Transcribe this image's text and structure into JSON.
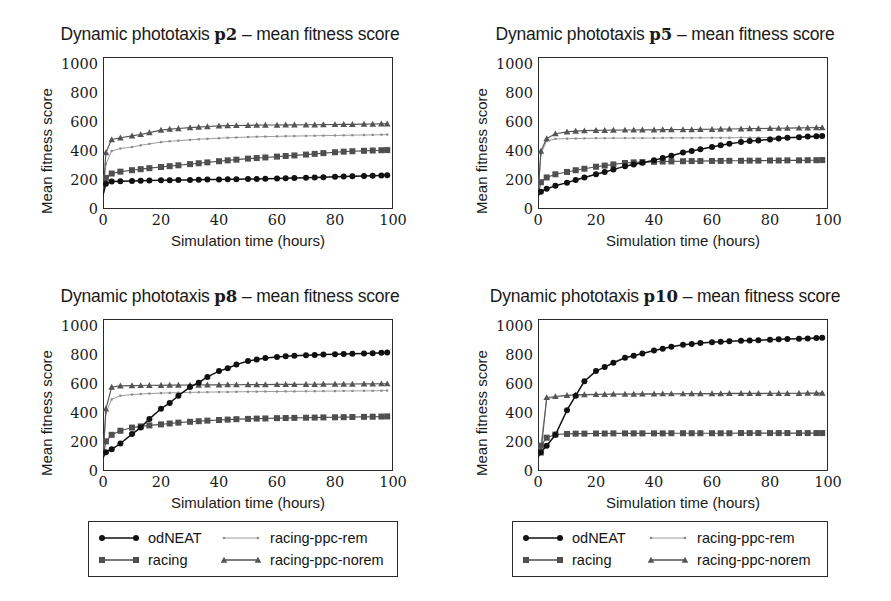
{
  "figure": {
    "axis_label_y": "Mean fitness score",
    "axis_label_x": "Simulation time (hours)"
  },
  "legend": {
    "entries": [
      {
        "label": "odNEAT",
        "marker": "circle-marker",
        "color": "#111111"
      },
      {
        "label": "racing",
        "marker": "square-marker",
        "color": "#4f4f4f"
      },
      {
        "label": "racing-ppc-rem",
        "marker": "dot-marker",
        "color": "#8a8a8a"
      },
      {
        "label": "racing-ppc-norem",
        "marker": "triangle-marker",
        "color": "#555555"
      }
    ]
  },
  "chart_data": [
    {
      "type": "line",
      "panel": "p2",
      "title_prefix": "Dynamic phototaxis ",
      "title_var": "p2",
      "title_suffix": " – mean fitness score",
      "xlabel": "Simulation time (hours)",
      "ylabel": "Mean fitness score",
      "xlim": [
        0,
        100
      ],
      "ylim": [
        0,
        1050
      ],
      "xticks": [
        0,
        20,
        40,
        60,
        80,
        100
      ],
      "yticks": [
        0,
        200,
        400,
        600,
        800,
        1000
      ],
      "grid": false,
      "legend_position": "below-figure",
      "x": [
        0,
        1,
        3,
        6,
        10,
        13,
        16,
        20,
        23,
        26,
        30,
        33,
        36,
        40,
        43,
        46,
        50,
        53,
        56,
        60,
        63,
        66,
        70,
        73,
        76,
        80,
        83,
        86,
        90,
        93,
        96,
        98
      ],
      "series": [
        {
          "name": "odNEAT",
          "marker": "circle",
          "color": "#111111",
          "values": [
            95,
            175,
            190,
            192,
            194,
            196,
            197,
            198,
            199,
            200,
            201,
            202,
            203,
            204,
            205,
            206,
            207,
            208,
            209,
            210,
            212,
            214,
            216,
            218,
            220,
            222,
            224,
            226,
            228,
            230,
            232,
            233
          ]
        },
        {
          "name": "racing",
          "marker": "square",
          "color": "#4f4f4f",
          "values": [
            95,
            215,
            245,
            258,
            268,
            275,
            282,
            290,
            296,
            302,
            310,
            316,
            322,
            330,
            336,
            341,
            348,
            352,
            356,
            362,
            366,
            370,
            376,
            381,
            386,
            392,
            396,
            399,
            402,
            404,
            406,
            407
          ]
        },
        {
          "name": "racing-ppc-rem",
          "marker": "dot",
          "color": "#8a8a8a",
          "values": [
            95,
            310,
            400,
            418,
            428,
            440,
            450,
            462,
            468,
            472,
            478,
            482,
            485,
            489,
            492,
            494,
            497,
            499,
            500,
            502,
            503,
            504,
            505,
            506,
            507,
            508,
            509,
            510,
            511,
            512,
            513,
            514
          ]
        },
        {
          "name": "racing-ppc-norem",
          "marker": "triangle",
          "color": "#555555",
          "values": [
            95,
            390,
            480,
            492,
            505,
            515,
            528,
            545,
            552,
            556,
            562,
            566,
            570,
            574,
            576,
            577,
            578,
            579,
            580,
            580,
            581,
            581,
            582,
            582,
            583,
            584,
            585,
            585,
            586,
            587,
            588,
            589
          ]
        }
      ]
    },
    {
      "type": "line",
      "panel": "p5",
      "title_prefix": "Dynamic phototaxis ",
      "title_var": "p5",
      "title_suffix": " – mean fitness score",
      "xlabel": "Simulation time (hours)",
      "ylabel": "Mean fitness score",
      "xlim": [
        0,
        100
      ],
      "ylim": [
        0,
        1050
      ],
      "xticks": [
        0,
        20,
        40,
        60,
        80,
        100
      ],
      "yticks": [
        0,
        200,
        400,
        600,
        800,
        1000
      ],
      "grid": false,
      "legend_position": "below-figure",
      "x": [
        0,
        1,
        3,
        6,
        10,
        13,
        16,
        20,
        23,
        26,
        30,
        33,
        36,
        40,
        43,
        46,
        50,
        53,
        56,
        60,
        63,
        66,
        70,
        73,
        76,
        80,
        83,
        86,
        90,
        93,
        96,
        98
      ],
      "series": [
        {
          "name": "odNEAT",
          "marker": "circle",
          "color": "#111111",
          "values": [
            90,
            120,
            140,
            160,
            182,
            200,
            218,
            240,
            256,
            272,
            296,
            308,
            320,
            336,
            352,
            368,
            390,
            400,
            412,
            428,
            440,
            450,
            462,
            470,
            474,
            480,
            487,
            492,
            496,
            500,
            503,
            505
          ]
        },
        {
          "name": "racing",
          "marker": "square",
          "color": "#4f4f4f",
          "values": [
            90,
            185,
            218,
            240,
            256,
            268,
            278,
            292,
            300,
            308,
            318,
            322,
            324,
            326,
            328,
            329,
            330,
            331,
            331,
            332,
            332,
            333,
            333,
            334,
            334,
            335,
            335,
            336,
            336,
            337,
            337,
            338
          ]
        },
        {
          "name": "racing-ppc-rem",
          "marker": "dot",
          "color": "#8a8a8a",
          "values": [
            90,
            380,
            470,
            484,
            486,
            487,
            488,
            489,
            489,
            490,
            490,
            490,
            490,
            490,
            491,
            491,
            491,
            491,
            492,
            492,
            492,
            492,
            493,
            493,
            493,
            494,
            494,
            494,
            495,
            495,
            495,
            496
          ]
        },
        {
          "name": "racing-ppc-norem",
          "marker": "triangle",
          "color": "#555555",
          "values": [
            90,
            400,
            487,
            520,
            533,
            538,
            541,
            543,
            544,
            545,
            546,
            546,
            547,
            547,
            548,
            548,
            549,
            549,
            550,
            551,
            552,
            553,
            554,
            555,
            556,
            557,
            558,
            559,
            560,
            561,
            562,
            563
          ]
        }
      ]
    },
    {
      "type": "line",
      "panel": "p8",
      "title_prefix": "Dynamic phototaxis ",
      "title_var": "p8",
      "title_suffix": " – mean fitness score",
      "xlabel": "Simulation time (hours)",
      "ylabel": "Mean fitness score",
      "xlim": [
        0,
        100
      ],
      "ylim": [
        0,
        1050
      ],
      "xticks": [
        0,
        20,
        40,
        60,
        80,
        100
      ],
      "yticks": [
        0,
        200,
        400,
        600,
        800,
        1000
      ],
      "grid": false,
      "legend_position": "below-figure",
      "x": [
        0,
        1,
        3,
        6,
        10,
        13,
        16,
        20,
        23,
        26,
        30,
        33,
        36,
        40,
        43,
        46,
        50,
        53,
        56,
        60,
        63,
        66,
        70,
        73,
        76,
        80,
        83,
        86,
        90,
        93,
        96,
        98
      ],
      "series": [
        {
          "name": "odNEAT",
          "marker": "circle",
          "color": "#111111",
          "values": [
            90,
            130,
            150,
            190,
            255,
            300,
            360,
            430,
            470,
            520,
            580,
            610,
            650,
            690,
            710,
            735,
            760,
            770,
            780,
            788,
            792,
            796,
            800,
            802,
            804,
            806,
            808,
            810,
            812,
            814,
            816,
            818
          ]
        },
        {
          "name": "racing",
          "marker": "square",
          "color": "#4f4f4f",
          "values": [
            90,
            205,
            250,
            278,
            300,
            308,
            315,
            322,
            328,
            334,
            340,
            344,
            348,
            352,
            355,
            358,
            360,
            362,
            363,
            365,
            366,
            367,
            368,
            369,
            370,
            371,
            372,
            373,
            374,
            375,
            376,
            377
          ]
        },
        {
          "name": "racing-ppc-rem",
          "marker": "dot",
          "color": "#8a8a8a",
          "values": [
            90,
            400,
            495,
            520,
            528,
            532,
            535,
            538,
            540,
            541,
            543,
            544,
            545,
            546,
            546,
            547,
            548,
            548,
            549,
            549,
            550,
            550,
            551,
            551,
            552,
            552,
            553,
            553,
            554,
            554,
            555,
            556
          ]
        },
        {
          "name": "racing-ppc-norem",
          "marker": "triangle",
          "color": "#555555",
          "values": [
            90,
            430,
            580,
            588,
            590,
            591,
            592,
            592,
            593,
            593,
            594,
            594,
            595,
            595,
            596,
            596,
            597,
            597,
            597,
            598,
            598,
            598,
            599,
            599,
            600,
            600,
            601,
            601,
            602,
            602,
            603,
            603
          ]
        }
      ]
    },
    {
      "type": "line",
      "panel": "p10",
      "title_prefix": "Dynamic phototaxis ",
      "title_var": "p10",
      "title_suffix": " – mean fitness score",
      "xlabel": "Simulation time (hours)",
      "ylabel": "Mean fitness score",
      "xlim": [
        0,
        100
      ],
      "ylim": [
        0,
        1050
      ],
      "xticks": [
        0,
        20,
        40,
        60,
        80,
        100
      ],
      "yticks": [
        0,
        200,
        400,
        600,
        800,
        1000
      ],
      "grid": false,
      "legend_position": "below-figure",
      "x": [
        0,
        1,
        3,
        6,
        10,
        13,
        16,
        20,
        23,
        26,
        30,
        33,
        36,
        40,
        43,
        46,
        50,
        53,
        56,
        60,
        63,
        66,
        70,
        73,
        76,
        80,
        83,
        86,
        90,
        93,
        96,
        98
      ],
      "series": [
        {
          "name": "odNEAT",
          "marker": "circle",
          "color": "#111111",
          "values": [
            95,
            130,
            175,
            250,
            420,
            520,
            620,
            690,
            718,
            748,
            782,
            796,
            812,
            832,
            845,
            858,
            872,
            878,
            884,
            890,
            893,
            896,
            900,
            902,
            904,
            907,
            910,
            912,
            914,
            916,
            918,
            920
          ]
        },
        {
          "name": "racing",
          "marker": "square",
          "color": "#4f4f4f",
          "values": [
            95,
            175,
            230,
            252,
            256,
            258,
            258,
            259,
            259,
            260,
            260,
            260,
            260,
            260,
            260,
            261,
            261,
            261,
            261,
            261,
            261,
            261,
            262,
            262,
            262,
            262,
            262,
            262,
            262,
            262,
            262,
            262
          ]
        },
        {
          "name": "racing-ppc-rem",
          "marker": "dot",
          "color": "#8a8a8a",
          "values": [
            95,
            180,
            498,
            510,
            520,
            524,
            526,
            528,
            529,
            530,
            530,
            531,
            531,
            531,
            532,
            532,
            532,
            532,
            533,
            533,
            533,
            533,
            533,
            534,
            534,
            534,
            534,
            535,
            535,
            535,
            535,
            536
          ]
        },
        {
          "name": "racing-ppc-norem",
          "marker": "triangle",
          "color": "#555555",
          "values": [
            95,
            125,
            508,
            515,
            523,
            526,
            528,
            529,
            530,
            531,
            532,
            532,
            533,
            533,
            534,
            534,
            534,
            535,
            535,
            535,
            535,
            536,
            536,
            536,
            536,
            537,
            537,
            537,
            537,
            538,
            538,
            538
          ]
        }
      ]
    }
  ]
}
